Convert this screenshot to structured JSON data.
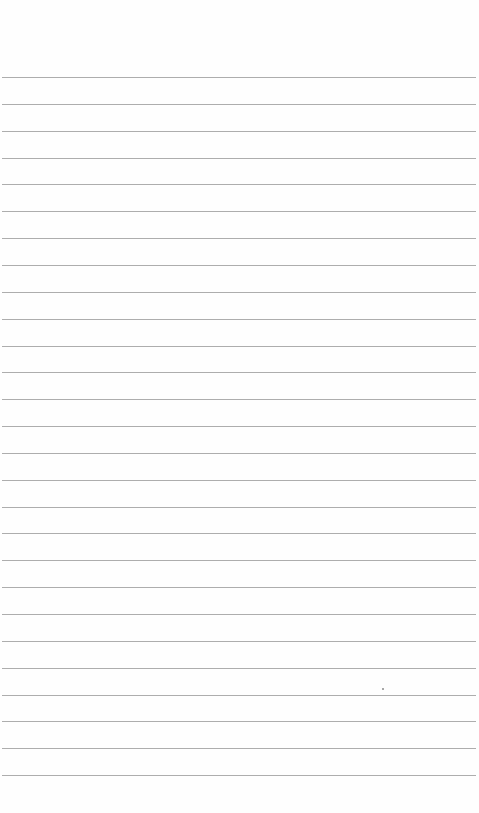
{
  "page": {
    "type": "lined-notebook-page",
    "background_color": "#fefefe",
    "line_color": "#a4a4a4",
    "line_count": 27,
    "first_line_y": 77,
    "line_spacing": 26.85,
    "line_left": 2,
    "line_right": 476,
    "text_content": []
  }
}
